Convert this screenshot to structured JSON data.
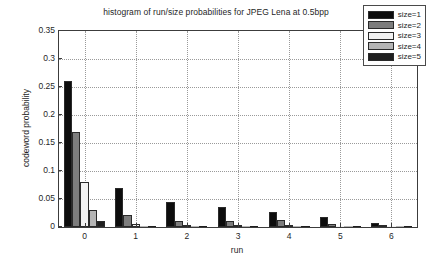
{
  "chart_data": {
    "type": "bar",
    "title": "histogram of run/size probabilities for JPEG Lena at 0.5bpp",
    "xlabel": "run",
    "ylabel": "codeword probability",
    "categories": [
      "0",
      "1",
      "2",
      "3",
      "4",
      "5",
      "6"
    ],
    "x": [
      0,
      1,
      2,
      3,
      4,
      5,
      6
    ],
    "xlim": [
      -0.5,
      6.5
    ],
    "ylim": [
      0,
      0.35
    ],
    "yticks": [
      0,
      0.05,
      0.1,
      0.15,
      0.2,
      0.25,
      0.3,
      0.35
    ],
    "ytick_labels": [
      "0",
      "0.05",
      "0.1",
      "0.15",
      "0.2",
      "0.25",
      "0.3",
      "0.35"
    ],
    "xticks": [
      0,
      1,
      2,
      3,
      4,
      5,
      6
    ],
    "xtick_labels": [
      "0",
      "1",
      "2",
      "3",
      "4",
      "5",
      "6"
    ],
    "grid": true,
    "grid_style": "dotted",
    "legend_position": "upper right",
    "series": [
      {
        "name": "size=1",
        "color": "#0d0d0d",
        "values": [
          0.26,
          0.07,
          0.045,
          0.036,
          0.027,
          0.017,
          0.007
        ]
      },
      {
        "name": "size=2",
        "color": "#7d7d7d",
        "values": [
          0.169,
          0.021,
          0.011,
          0.011,
          0.012,
          0.006,
          0.003
        ]
      },
      {
        "name": "size=3",
        "color": "#f2f2f2",
        "values": [
          0.081,
          0.005,
          0.003,
          0.003,
          0.003,
          0.002,
          0.001
        ]
      },
      {
        "name": "size=4",
        "color": "#b5b5b5",
        "values": [
          0.03,
          0.002,
          0.001,
          0.001,
          0.001,
          0.001,
          0.0
        ]
      },
      {
        "name": "size=5",
        "color": "#1f1f1f",
        "values": [
          0.01,
          0.001,
          0.001,
          0.0,
          0.0,
          0.0,
          0.0
        ]
      }
    ]
  },
  "legend": {
    "entries": [
      {
        "label": "size=1",
        "color": "#0d0d0d"
      },
      {
        "label": "size=2",
        "color": "#7d7d7d"
      },
      {
        "label": "size=3",
        "color": "#f2f2f2"
      },
      {
        "label": "size=4",
        "color": "#b5b5b5"
      },
      {
        "label": "size=5",
        "color": "#1f1f1f"
      }
    ]
  },
  "axes": {
    "plot_bg": "#ffffff",
    "axis_color": "#3c3c3c",
    "grid_color": "#9a9a9a"
  }
}
